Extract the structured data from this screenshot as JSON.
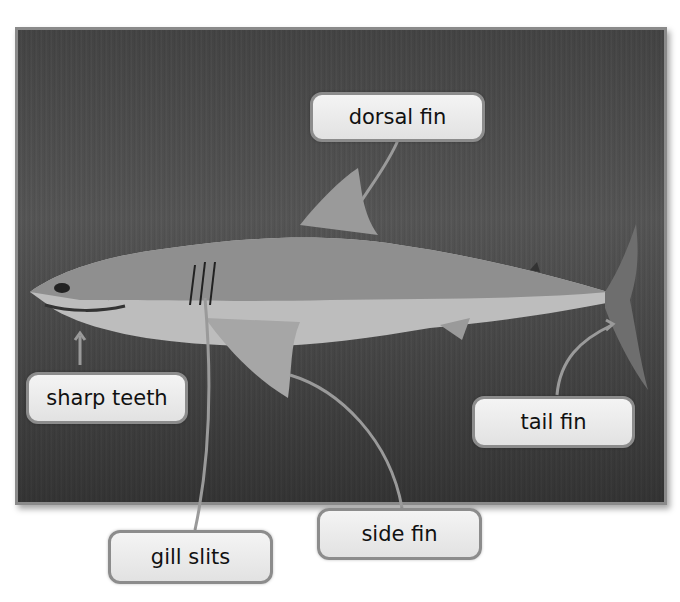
{
  "diagram": {
    "labels": {
      "dorsal_fin": "dorsal fin",
      "sharp_teeth": "sharp teeth",
      "tail_fin": "tail fin",
      "side_fin": "side fin",
      "gill_slits": "gill slits"
    },
    "colors": {
      "label_border": "#8c8c8c",
      "label_fill": "#eeeeee",
      "leader_line": "#9a9a9a",
      "water": "#505050"
    }
  }
}
